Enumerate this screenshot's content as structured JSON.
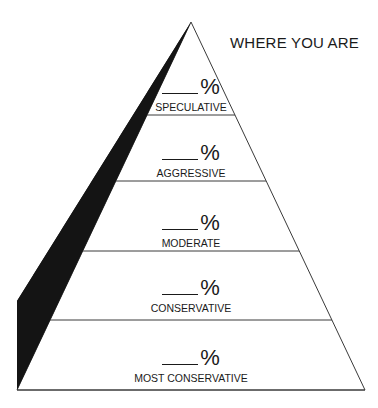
{
  "title": "WHERE YOU ARE",
  "tiers": [
    {
      "blank": "____",
      "unit": "%",
      "label": "SPECULATIVE"
    },
    {
      "blank": "____",
      "unit": "%",
      "label": "AGGRESSIVE"
    },
    {
      "blank": "____",
      "unit": "%",
      "label": "MODERATE"
    },
    {
      "blank": "____",
      "unit": "%",
      "label": "CONSERVATIVE"
    },
    {
      "blank": "____",
      "unit": "%",
      "label": "MOST CONSERVATIVE"
    }
  ],
  "colors": {
    "line": "#3a3a3a",
    "shadow": "#141414",
    "text": "#1a1a1a"
  }
}
